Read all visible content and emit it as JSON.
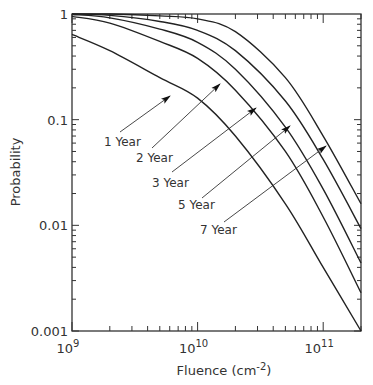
{
  "chart_data": {
    "type": "line",
    "title": "",
    "xlabel": "Fluence (cm-2)",
    "ylabel": "Probability",
    "xscale": "log",
    "yscale": "log",
    "xlim": [
      1000000000.0,
      200000000000.0
    ],
    "ylim": [
      0.001,
      1
    ],
    "grid": false,
    "legend": "inline annotations with arrows",
    "x_tick_labels": [
      "10^9",
      "10^10",
      "10^11"
    ],
    "y_tick_labels": [
      "1",
      "0.1",
      "0.01",
      "0.001"
    ],
    "x": [
      1000000000.0,
      2000000000.0,
      5000000000.0,
      10000000000.0,
      20000000000.0,
      50000000000.0,
      100000000000.0,
      200000000000.0
    ],
    "series": [
      {
        "name": "1 Year",
        "values": [
          0.64,
          0.45,
          0.25,
          0.16,
          0.07,
          0.016,
          0.004,
          0.001
        ]
      },
      {
        "name": "2 Year",
        "values": [
          0.95,
          0.82,
          0.55,
          0.38,
          0.19,
          0.05,
          0.012,
          0.0023
        ]
      },
      {
        "name": "3 Year",
        "values": [
          0.99,
          0.92,
          0.72,
          0.54,
          0.3,
          0.085,
          0.022,
          0.0044
        ]
      },
      {
        "name": "5 Year",
        "values": [
          1.0,
          0.97,
          0.85,
          0.7,
          0.45,
          0.15,
          0.042,
          0.0093
        ]
      },
      {
        "name": "7 Year",
        "values": [
          1.0,
          1.0,
          0.96,
          0.9,
          0.68,
          0.25,
          0.07,
          0.016
        ]
      }
    ]
  },
  "axes": {
    "ylabel": "Probability",
    "xlabel_prefix": "Fluence (cm",
    "xlabel_sup": "-2",
    "xlabel_suffix": ")",
    "y_ticks": [
      {
        "label": "1",
        "value": 1
      },
      {
        "label": "0.1",
        "value": 0.1
      },
      {
        "label": "0.01",
        "value": 0.01
      },
      {
        "label": "0.001",
        "value": 0.001
      }
    ],
    "x_ticks": [
      {
        "base": "10",
        "exp": "9",
        "value": 1000000000.0
      },
      {
        "base": "10",
        "exp": "10",
        "value": 10000000000.0
      },
      {
        "base": "10",
        "exp": "11",
        "value": 100000000000.0
      }
    ]
  },
  "annotations": [
    {
      "label": "1 Year",
      "text_x": 104,
      "text_y": 146,
      "from": [
        120,
        132
      ],
      "to": [
        170,
        96
      ]
    },
    {
      "label": "2 Year",
      "text_x": 136,
      "text_y": 162,
      "from": [
        152,
        148
      ],
      "to": [
        220,
        84
      ]
    },
    {
      "label": "3 Year",
      "text_x": 152,
      "text_y": 187,
      "from": [
        172,
        172
      ],
      "to": [
        256,
        108
      ]
    },
    {
      "label": "5 Year",
      "text_x": 178,
      "text_y": 209,
      "from": [
        202,
        198
      ],
      "to": [
        290,
        126
      ]
    },
    {
      "label": "7 Year",
      "text_x": 200,
      "text_y": 234,
      "from": [
        224,
        222
      ],
      "to": [
        326,
        146
      ]
    }
  ]
}
